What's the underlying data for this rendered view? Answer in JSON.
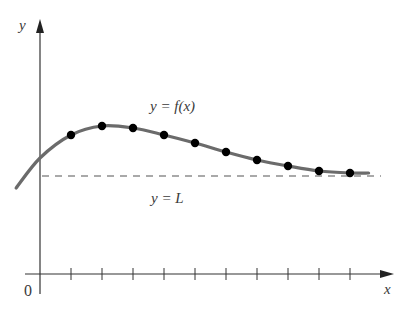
{
  "chart_data": {
    "type": "line",
    "title": "",
    "xlabel": "x",
    "ylabel": "y",
    "origin_label": "0",
    "curve_label": "y = f(x)",
    "asymptote_label": "y = L",
    "asymptote": {
      "name": "y = L",
      "value": 4.9,
      "style": "dashed"
    },
    "x_ticks": [
      1,
      2,
      3,
      4,
      5,
      6,
      7,
      8,
      9,
      10
    ],
    "x_tick_labels_shown": false,
    "y_ticks": [],
    "xlim": [
      -0.8,
      10.7
    ],
    "ylim": [
      0,
      12.7
    ],
    "grid": false,
    "legend": null,
    "series": [
      {
        "name": "y = f(x)",
        "kind": "smooth curve",
        "x": [
          -0.77,
          0,
          1,
          2,
          3,
          4,
          5,
          6,
          7,
          8,
          9,
          10,
          10.6
        ],
        "values": [
          4.3,
          5.8,
          6.95,
          7.4,
          7.3,
          6.95,
          6.55,
          6.1,
          5.7,
          5.4,
          5.15,
          5.05,
          5.05
        ]
      },
      {
        "name": "sample points",
        "kind": "markers",
        "x": [
          1,
          2,
          3,
          4,
          5,
          6,
          7,
          8,
          9,
          10
        ],
        "values": [
          6.95,
          7.4,
          7.3,
          6.95,
          6.55,
          6.1,
          5.7,
          5.4,
          5.15,
          5.05
        ]
      }
    ],
    "colors": {
      "axis": "#333333",
      "curve": "#6b6b6b",
      "points": "#000000",
      "asymptote": "#555555",
      "text": "#3a3a3a"
    }
  }
}
